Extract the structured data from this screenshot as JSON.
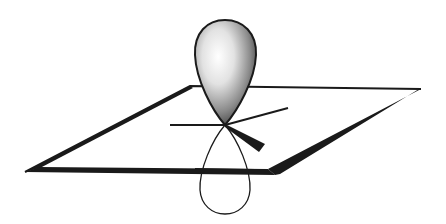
{
  "figure": {
    "title": "p orbital perpendicular to trigonal planar (sp2) bond plane",
    "elements": {
      "plane": "molecular-plane",
      "upper_lobe": "p-orbital-upper-lobe (shaded)",
      "lower_lobe": "p-orbital-lower-lobe (outline)",
      "bonds": [
        "bond-left",
        "bond-back-right",
        "bond-front-right-wedge"
      ]
    },
    "colors": {
      "stroke": "#1a1a1a",
      "background": "#ffffff",
      "lobe_highlight": "#ffffff",
      "lobe_shadow": "#2a2a2a"
    }
  }
}
